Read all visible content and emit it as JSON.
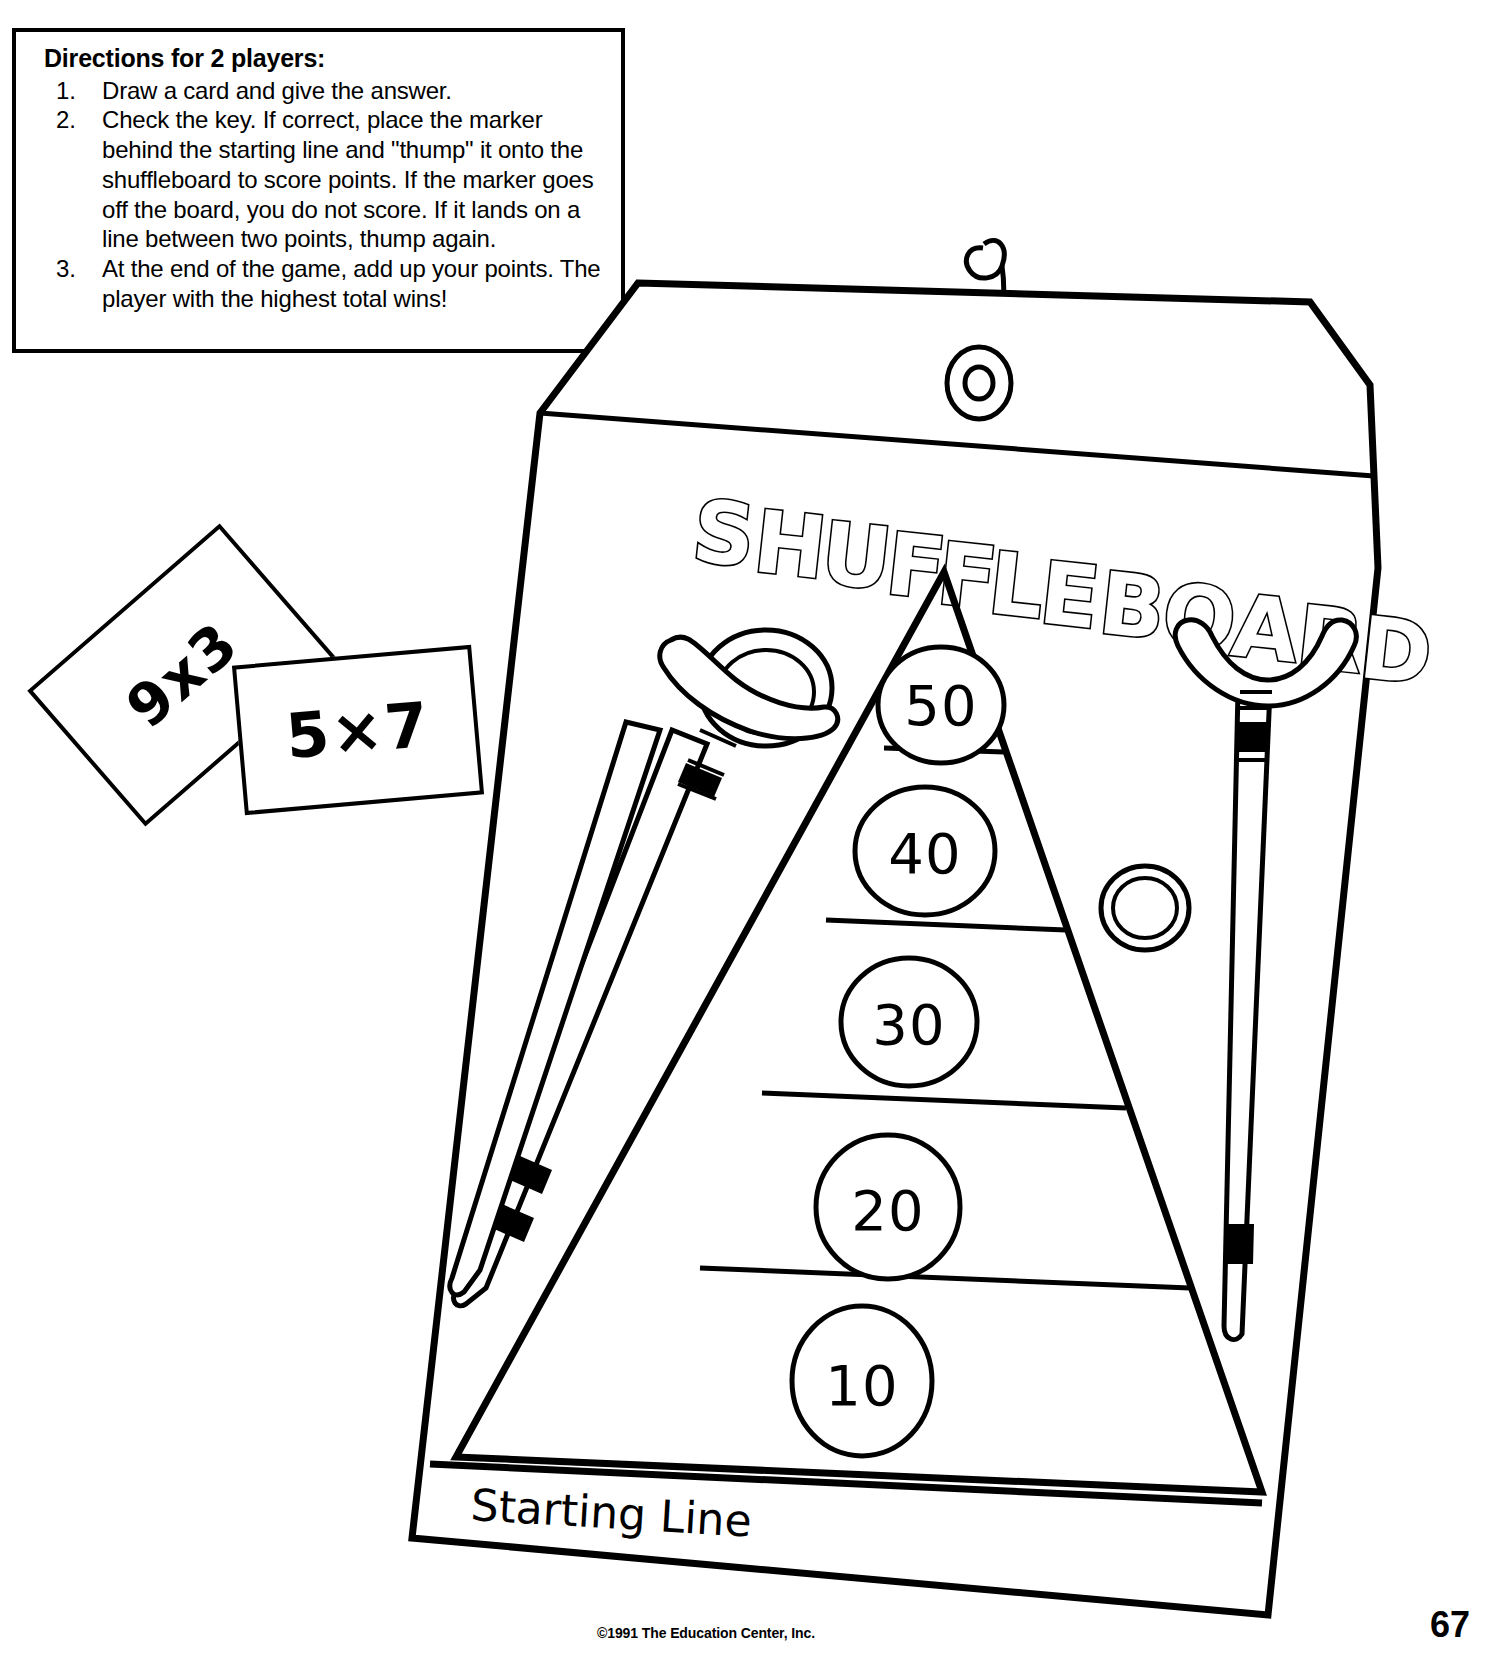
{
  "page": {
    "width": 1493,
    "height": 1657,
    "background_color": "#ffffff",
    "ink_color": "#000000"
  },
  "directions": {
    "title": "Directions for 2 players:",
    "items": [
      {
        "number": "1.",
        "text": "Draw a card and give the answer."
      },
      {
        "number": "2.",
        "text": "Check the key. If correct, place the marker behind the starting line and \"thump\" it onto the shuffleboard to score points. If the marker goes off the board, you do not score. If it lands on a line between two points, thump again."
      },
      {
        "number": "3.",
        "text": "At the end of the game, add up your points. The player with the highest total wins!"
      }
    ]
  },
  "flash_cards": [
    {
      "id": "card-9x3",
      "face": "9x3",
      "rotation_deg": -41
    },
    {
      "id": "card-5x7",
      "face": "5×7",
      "rotation_deg": -5
    }
  ],
  "board": {
    "title": "SHUFFLEBOARD",
    "title_letters": [
      "S",
      "H",
      "U",
      "F",
      "F",
      "L",
      "E",
      "B",
      "O",
      "A",
      "R",
      "D"
    ],
    "starting_line_label": "Starting Line",
    "hanger": "wire-hook",
    "grommet": "eyelet",
    "score_zones": [
      {
        "value": "50",
        "zone": 5
      },
      {
        "value": "40",
        "zone": 4
      },
      {
        "value": "30",
        "zone": 3
      },
      {
        "value": "20",
        "zone": 2
      },
      {
        "value": "10",
        "zone": 1
      }
    ]
  },
  "equipment": {
    "cues": [
      {
        "id": "cue-left",
        "name": "shuffleboard-cue-left",
        "bands": 2
      },
      {
        "id": "cue-right",
        "name": "shuffleboard-cue-right",
        "bands": 2
      }
    ],
    "pucks": [
      {
        "id": "puck-left",
        "name": "shuffleboard-puck-left"
      },
      {
        "id": "puck-right",
        "name": "shuffleboard-puck-right"
      }
    ]
  },
  "footer": {
    "copyright": "©1991 The Education Center, Inc.",
    "page_number": "67"
  }
}
